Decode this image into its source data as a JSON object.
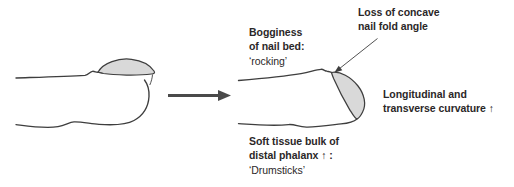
{
  "labels": {
    "bogginess": {
      "line1": "Bogginess",
      "line2": "of nail bed:",
      "line3": "‘rocking’"
    },
    "nail_fold": {
      "line1": "Loss of concave",
      "line2": "nail fold angle"
    },
    "curvature": {
      "line1": "Longitudinal and",
      "line2": "transverse curvature ↑"
    },
    "soft_tissue": {
      "line1": "Soft tissue bulk of",
      "line2": "distal phalanx ↑ :",
      "line3": "‘Drumsticks’"
    }
  },
  "icons": {
    "transform_arrow": "right-arrow",
    "annotation_arrow": "pointer-arrow"
  },
  "colors": {
    "background": "#ffffff",
    "outline": "#3e3e3e",
    "nail_fill": "#d9d9d9",
    "arrow": "#4a4a4a",
    "text": "#2b2728"
  }
}
